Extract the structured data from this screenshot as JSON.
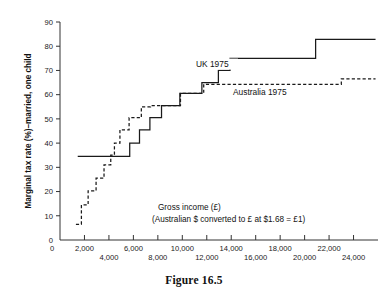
{
  "figure": {
    "caption": "Figure 16.5"
  },
  "chart_data": {
    "type": "line",
    "title": "",
    "xlabel": "Gross income (£)",
    "ylabel": "Marginal tax rate (%)–married, one child",
    "xlim": [
      0,
      26000
    ],
    "ylim": [
      0,
      90
    ],
    "grid": false,
    "legend_position": "inline-annotation",
    "xticks": [
      2000,
      4000,
      6000,
      8000,
      10000,
      12000,
      14000,
      16000,
      18000,
      20000,
      22000,
      24000
    ],
    "xtick_labels_row1": [
      "2,000",
      "6,000",
      "10,000",
      "14,000",
      "18,000",
      "22,000"
    ],
    "xtick_labels_row2": [
      "4,000",
      "8,000",
      "12,000",
      "16,000",
      "20,000",
      "24,000"
    ],
    "x_origin_label": "0",
    "yticks": [
      0,
      10,
      20,
      30,
      40,
      50,
      60,
      70,
      80,
      90
    ],
    "ytick_labels": [
      "0",
      "10",
      "20",
      "30",
      "40",
      "50",
      "60",
      "70",
      "80",
      "90"
    ],
    "annotations": [
      "Gross income (£)",
      "(Australian $ converted to £ at $1.68 = £1)"
    ],
    "series": [
      {
        "name": "UK 1975",
        "style": "solid",
        "color": "#1a1a1a",
        "step_points": [
          [
            1450,
            34.5
          ],
          [
            5700,
            34.5
          ],
          [
            5700,
            40.0
          ],
          [
            6500,
            40.0
          ],
          [
            6500,
            45.5
          ],
          [
            7350,
            45.5
          ],
          [
            7350,
            50.5
          ],
          [
            8300,
            50.5
          ],
          [
            8300,
            55.5
          ],
          [
            9800,
            55.5
          ],
          [
            9800,
            60.5
          ],
          [
            11600,
            60.5
          ],
          [
            11600,
            65.0
          ],
          [
            12950,
            65.0
          ],
          [
            12950,
            70.0
          ],
          [
            13900,
            70.0
          ],
          [
            13900,
            75.0
          ],
          [
            20900,
            75.0
          ],
          [
            20900,
            82.8
          ],
          [
            25800,
            82.8
          ]
        ]
      },
      {
        "name": "Australia 1975",
        "style": "dashed",
        "color": "#1a1a1a",
        "step_points": [
          [
            1300,
            6.5
          ],
          [
            1750,
            6.5
          ],
          [
            1750,
            14.5
          ],
          [
            2300,
            14.5
          ],
          [
            2300,
            20.3
          ],
          [
            2950,
            20.3
          ],
          [
            2950,
            25.5
          ],
          [
            3600,
            25.5
          ],
          [
            3600,
            31.0
          ],
          [
            4150,
            31.0
          ],
          [
            4150,
            35.0
          ],
          [
            4450,
            35.0
          ],
          [
            4450,
            40.0
          ],
          [
            4900,
            40.0
          ],
          [
            4900,
            45.5
          ],
          [
            5650,
            45.5
          ],
          [
            5650,
            50.5
          ],
          [
            6650,
            50.5
          ],
          [
            6650,
            55.0
          ],
          [
            7400,
            55.0
          ],
          [
            7400,
            55.5
          ],
          [
            9850,
            55.5
          ],
          [
            9850,
            60.5
          ],
          [
            11750,
            60.5
          ],
          [
            11750,
            64.3
          ],
          [
            23000,
            64.3
          ],
          [
            23000,
            66.5
          ],
          [
            25800,
            66.5
          ]
        ]
      }
    ]
  }
}
